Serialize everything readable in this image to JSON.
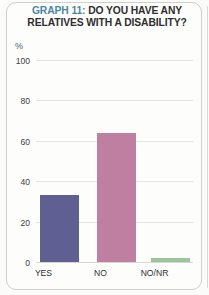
{
  "card": {
    "background_color": "#fdfdfc",
    "border_color": "#cfcfcb"
  },
  "title": {
    "graph_number": "GRAPH 11:",
    "line1_rest": " DO YOU HAVE ANY",
    "line2": "RELATIVES WITH A DISABILITY?",
    "graph_number_color": "#4a87a0",
    "text_color": "#2e2e2e"
  },
  "chart_data": {
    "type": "bar",
    "title": "GRAPH 11: DO YOU HAVE ANY RELATIVES WITH A DISABILITY?",
    "categories": [
      "YES",
      "NO",
      "NO/NR"
    ],
    "values": [
      33,
      64,
      2
    ],
    "xlabel": "",
    "ylabel": "%",
    "ylim": [
      0,
      100
    ],
    "yticks": [
      "0",
      "20",
      "40",
      "60",
      "80",
      "100"
    ],
    "grid": true,
    "legend": "none",
    "bar_colors": [
      "#5f5f91",
      "#bf7fa0",
      "#9dc49a"
    ]
  }
}
